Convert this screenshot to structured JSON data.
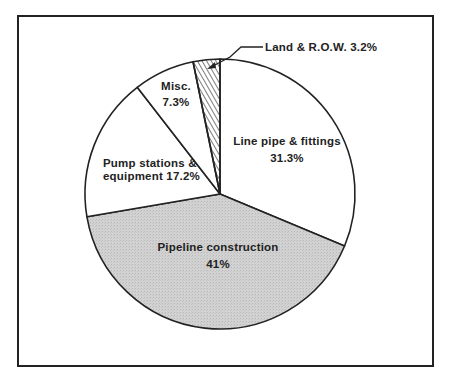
{
  "chart_data": {
    "type": "pie",
    "title": "",
    "start_angle_deg": 0,
    "direction": "clockwise",
    "slices": [
      {
        "label": "Line pipe & fittings",
        "value": 31.3,
        "display": "31.3%",
        "fill": "#ffffff",
        "pattern": "none"
      },
      {
        "label": "Pipeline construction",
        "value": 41.0,
        "display": "41%",
        "fill": "#cfcfcf",
        "pattern": "stipple"
      },
      {
        "label": "Pump stations & equipment",
        "value": 17.2,
        "display": "17.2%",
        "fill": "#ffffff",
        "pattern": "none"
      },
      {
        "label": "Misc.",
        "value": 7.3,
        "display": "7.3%",
        "fill": "#ffffff",
        "pattern": "none"
      },
      {
        "label": "Land & R.O.W.",
        "value": 3.2,
        "display": "3.2%",
        "fill": "#ffffff",
        "pattern": "diagonal-hatch"
      }
    ],
    "legend": "none",
    "annotations": [
      {
        "text": "Land & R.O.W. 3.2%",
        "type": "callout-arrow",
        "target": "Land & R.O.W."
      }
    ]
  },
  "labels": {
    "line_pipe_1": "Line pipe & fittings",
    "line_pipe_2": "31.3%",
    "pipeline_1": "Pipeline construction",
    "pipeline_2": "41%",
    "pump_1": "Pump stations &",
    "pump_2": "equipment 17.2%",
    "misc_1": "Misc.",
    "misc_2": "7.3%",
    "land": "Land & R.O.W. 3.2%"
  },
  "colors": {
    "outline": "#222222",
    "shaded": "#cfcfcf",
    "background": "#ffffff"
  }
}
